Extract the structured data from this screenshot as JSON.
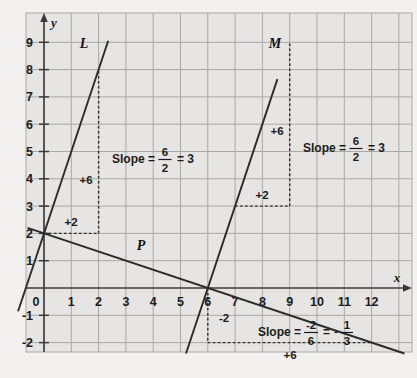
{
  "figure": {
    "title": "",
    "background_color": "#f2f1ef",
    "plot_background_color": "#e6e5e3",
    "grid_color": "#a9a8a6",
    "axis_color": "#3a3a3a",
    "line_color": "#2b2b2b"
  },
  "axes": {
    "x_name": "x",
    "y_name": "y",
    "x_ticks": [
      "1",
      "2",
      "3",
      "4",
      "5",
      "6",
      "7",
      "8",
      "9",
      "10",
      "11",
      "12"
    ],
    "y_ticks": [
      "9",
      "8",
      "7",
      "6",
      "5",
      "4",
      "3",
      "2",
      "1",
      "-1",
      "-2"
    ],
    "origin_label": "0",
    "x_min": -0.65,
    "x_max": 13.4,
    "y_min": -2.7,
    "y_max": 10.1
  },
  "lines": [
    {
      "name": "L",
      "label": "L",
      "slope": 3,
      "y_intercept": 2,
      "x_start": -0.95,
      "x_end": 2.35
    },
    {
      "name": "M",
      "label": "M",
      "slope": 3,
      "y_intercept": -18,
      "x_start": 5.2,
      "x_end": 8.55
    },
    {
      "name": "P",
      "label": "P",
      "slope": -0.3333333,
      "y_intercept": 2,
      "x_start": -0.6,
      "x_end": 13.2
    }
  ],
  "annotations": {
    "line_L": {
      "rise_label": "+6",
      "run_label": "+2",
      "slope_text": "Slope =",
      "numerator": "6",
      "denominator": "2",
      "equals": "= 3"
    },
    "line_M": {
      "rise_label": "+6",
      "run_label": "+2",
      "slope_text": "Slope =",
      "numerator": "6",
      "denominator": "2",
      "equals": "= 3"
    },
    "line_P": {
      "rise_label": "-2",
      "run_label": "+6",
      "slope_text": "Slope =",
      "numerator": "-2",
      "denominator": "6",
      "equals": "=",
      "result_sign": "-",
      "result_numerator": "1",
      "result_denominator": "3"
    }
  }
}
